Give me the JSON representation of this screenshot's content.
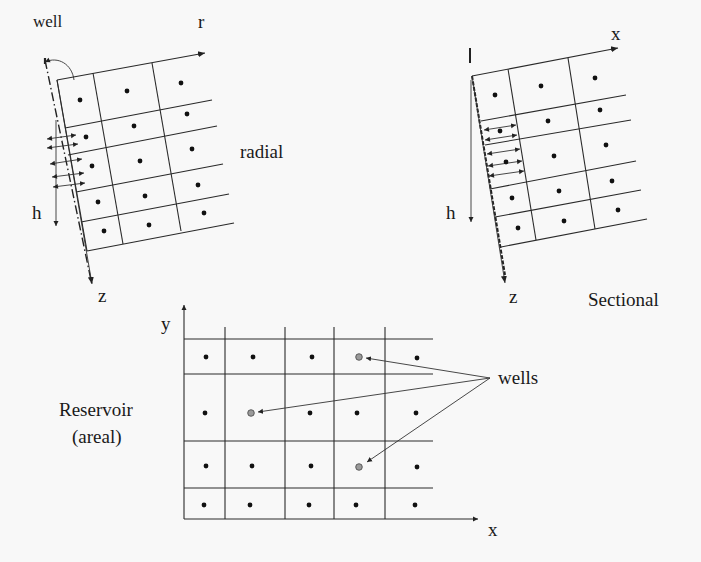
{
  "figure": {
    "radial": {
      "title": "radial",
      "well_label": "well",
      "axis_r": "r",
      "axis_h": "h",
      "axis_z": "z",
      "rows": 5,
      "cols": 3
    },
    "sectional": {
      "title": "Sectional",
      "axis_x": "x",
      "axis_h": "h",
      "axis_z": "z",
      "rows": 5,
      "cols": 3
    },
    "areal": {
      "title_line1": "Reservoir",
      "title_line2": "(areal)",
      "axis_x": "x",
      "axis_y": "y",
      "wells_label": "wells",
      "rows": 5,
      "cols": 5,
      "well_cells": [
        [
          0,
          3
        ],
        [
          1,
          1
        ],
        [
          2,
          3
        ]
      ]
    }
  },
  "colors": {
    "line": "#2a2a2a",
    "node": "#111111",
    "well_node": "#9a9a9a",
    "background": "#f8f8f8"
  }
}
